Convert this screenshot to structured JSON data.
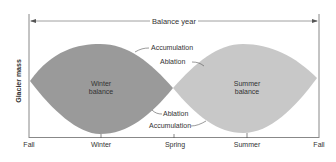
{
  "diagram": {
    "title": "Balance year",
    "ylabel": "Glacier mass",
    "x_labels": [
      "Fall",
      "Winter",
      "Spring",
      "Summer",
      "Fall"
    ],
    "regions": {
      "winter": {
        "line1": "Winter",
        "line2": "balance",
        "color": "#9a9a9a"
      },
      "summer": {
        "line1": "Summer",
        "line2": "balance",
        "color": "#c8c8c8"
      }
    },
    "annotations": {
      "top_accumulation": "Accumulation",
      "top_ablation": "Ablation",
      "bottom_ablation": "Ablation",
      "bottom_accumulation": "Accumulation"
    },
    "colors": {
      "axis": "#888888",
      "text": "#333333"
    }
  }
}
